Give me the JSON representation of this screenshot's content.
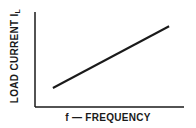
{
  "chart_data": {
    "type": "line",
    "title": "",
    "xlabel": "f — FREQUENCY",
    "ylabel": "LOAD CURRENT I",
    "ylabel_subscript": "L",
    "grid": false,
    "legend": null,
    "series": [
      {
        "name": "Load current vs frequency",
        "x": [
          0.12,
          0.9
        ],
        "y": [
          0.2,
          0.85
        ]
      }
    ],
    "xlim": [
      0,
      1
    ],
    "ylim": [
      0,
      1
    ],
    "colors": {
      "axis": "#1a1a1a",
      "line": "#1a1a1a"
    }
  }
}
